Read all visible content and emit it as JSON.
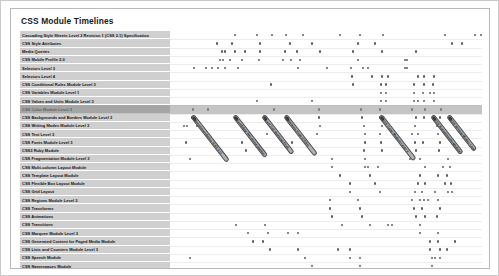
{
  "chart_title": "CSS Module Timelines",
  "chart_data": {
    "type": "scatter",
    "title": "CSS Module Timelines",
    "xlabel": "",
    "ylabel": "",
    "grid": true,
    "legend": "none",
    "highlighted_row_index": 9,
    "categories": [
      "Cascading Style Sheets Level 2 Revision 1 (CSS 2.1) Specification",
      "CSS Style Attributes",
      "Media Queries",
      "CSS Mobile Profile 2.0",
      "Selectors Level 3",
      "Selectors Level 4",
      "CSS Conditional Rules Module Level 3",
      "CSS Variables Module Level 1",
      "CSS Values and Units Module Level 3",
      "CSS Color Module Level 3",
      "CSS Backgrounds and Borders Module Level 3",
      "CSS Writing Modes Module Level 3",
      "CSS Text Level 3",
      "CSS Fonts Module Level 3",
      "CSS3 Ruby Module",
      "CSS Fragmentation Module Level 3",
      "CSS Multi-column Layout Module",
      "CSS Template Layout Module",
      "CSS Flexible Box Layout Module",
      "CSS Grid Layout",
      "CSS Regions Module Level 3",
      "CSS Transforms",
      "CSS Animations",
      "CSS Transitions",
      "CSS Marquee Module Level 3",
      "CSS Generated Content for Paged Media Module",
      "CSS Lists and Counters Module Level 3",
      "CSS Speech Module",
      "CSS Namespaces Module",
      "CSSOM View Module",
      "CSS Image Values and Replaced Content Module Level 3",
      "CSS Image Values and Replaced Content Module Level 4"
    ],
    "points": [
      {
        "row": 0,
        "xs": [
          215,
          237,
          252,
          266,
          283,
          320,
          340,
          363,
          425,
          455,
          461
        ]
      },
      {
        "row": 1,
        "xs": [
          197,
          212,
          240,
          270,
          292,
          338,
          355,
          432,
          442
        ]
      },
      {
        "row": 2,
        "xs": [
          202,
          205,
          215,
          225,
          240,
          265,
          277,
          300,
          333,
          362,
          396
        ]
      },
      {
        "row": 3,
        "xs": [
          200,
          203,
          210,
          222,
          239,
          263,
          271,
          280,
          338,
          385,
          387
        ]
      },
      {
        "row": 4,
        "xs": [
          174,
          186,
          192,
          198,
          205,
          218,
          278,
          307,
          331,
          343,
          348,
          385,
          387
        ]
      },
      {
        "row": 5,
        "xs": [
          332,
          352,
          362,
          368,
          398,
          404,
          414
        ]
      },
      {
        "row": 6,
        "xs": [
          251,
          333,
          361,
          366,
          394,
          404,
          413
        ]
      },
      {
        "row": 7,
        "xs": [
          361,
          366,
          394,
          403,
          410,
          414
        ]
      },
      {
        "row": 8,
        "xs": [
          237,
          292,
          361,
          366,
          394,
          398,
          404,
          414
        ]
      },
      {
        "row": 9,
        "xs": [
          173,
          188,
          254,
          299,
          341,
          360,
          392,
          405,
          421
        ]
      },
      {
        "row": 10,
        "xs": [
          172,
          246,
          299,
          342,
          360,
          363,
          396,
          404,
          420
        ]
      },
      {
        "row": 11,
        "xs": [
          164,
          167,
          177,
          180,
          252,
          300,
          344,
          362,
          395,
          417
        ]
      },
      {
        "row": 12,
        "xs": [
          247,
          297,
          345,
          360,
          392,
          398,
          418
        ]
      },
      {
        "row": 13,
        "xs": [
          166,
          222,
          272,
          345,
          361,
          395,
          403,
          420
        ]
      },
      {
        "row": 14,
        "xs": [
          226,
          292,
          344,
          362,
          396,
          419
        ]
      },
      {
        "row": 15,
        "xs": [
          170,
          205,
          312,
          345,
          390,
          400,
          428
        ]
      },
      {
        "row": 16,
        "xs": [
          312,
          345,
          348,
          358,
          405,
          423,
          430
        ]
      },
      {
        "row": 17,
        "xs": [
          320,
          350,
          400,
          418,
          427
        ]
      },
      {
        "row": 18,
        "xs": [
          330,
          355,
          398,
          405,
          425,
          431
        ]
      },
      {
        "row": 19,
        "xs": [
          330,
          360,
          395,
          402,
          415,
          428,
          432
        ]
      },
      {
        "row": 20,
        "xs": [
          310,
          338,
          392,
          400,
          404,
          408,
          418
        ]
      },
      {
        "row": 21,
        "xs": [
          310,
          340,
          394,
          402,
          420
        ]
      },
      {
        "row": 22,
        "xs": [
          312,
          342,
          396,
          405,
          417
        ]
      },
      {
        "row": 23,
        "xs": [
          216,
          245,
          322,
          350,
          368,
          372,
          400
        ]
      },
      {
        "row": 24,
        "xs": [
          228,
          248,
          268,
          278,
          400,
          418
        ]
      },
      {
        "row": 25,
        "xs": [
          233,
          243,
          410,
          418,
          435
        ]
      },
      {
        "row": 26,
        "xs": [
          250,
          278,
          318,
          330,
          410,
          420,
          427
        ]
      },
      {
        "row": 27,
        "xs": [
          170,
          285,
          330,
          340,
          412,
          415,
          420
        ]
      },
      {
        "row": 28,
        "xs": [
          292,
          340,
          412
        ]
      },
      {
        "row": 29,
        "xs": [
          300,
          330,
          352,
          400,
          412
        ]
      },
      {
        "row": 30,
        "xs": [
          340,
          362,
          400,
          412,
          418,
          424,
          430,
          438
        ]
      },
      {
        "row": 31,
        "xs": [
          440
        ]
      }
    ],
    "callouts": [
      {
        "text": "Recommendation (CSS 2.1)",
        "x": 172,
        "y": 82,
        "len": 58
      },
      {
        "text": "Candidate Recommendation",
        "x": 214,
        "y": 82,
        "len": 52
      },
      {
        "text": "Last Call Working Draft",
        "x": 243,
        "y": 82,
        "len": 48
      },
      {
        "text": "Working Draft (CSS3)",
        "x": 265,
        "y": 82,
        "len": 50
      },
      {
        "text": "CSS Color Module Level 3",
        "x": 360,
        "y": 82,
        "len": 56
      },
      {
        "text": "CSS Backgrounds Module",
        "x": 412,
        "y": 82,
        "len": 48
      },
      {
        "text": "CSS Writing Modes Level 3",
        "x": 428,
        "y": 82,
        "len": 44
      }
    ]
  }
}
